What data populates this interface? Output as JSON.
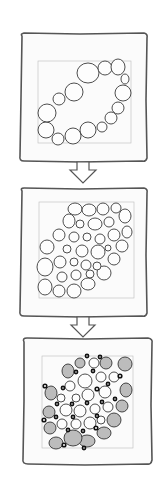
{
  "diagram": {
    "type": "step-sequence",
    "steps": [
      {
        "index": 1,
        "description": "ring of circles around an oval"
      },
      {
        "index": 2,
        "description": "interior filled with circles"
      },
      {
        "index": 3,
        "description": "shaded circles with dark dots"
      }
    ],
    "connectors": [
      {
        "from": 1,
        "to": 2,
        "icon": "down-arrow-icon"
      },
      {
        "from": 2,
        "to": 3,
        "icon": "down-arrow-icon"
      }
    ],
    "colors": {
      "frame_stroke": "#555555",
      "frame_fill": "#fbfbfb",
      "ink": "#3a3a3a",
      "shade": "#bcbcbc",
      "background": "#ffffff"
    }
  }
}
